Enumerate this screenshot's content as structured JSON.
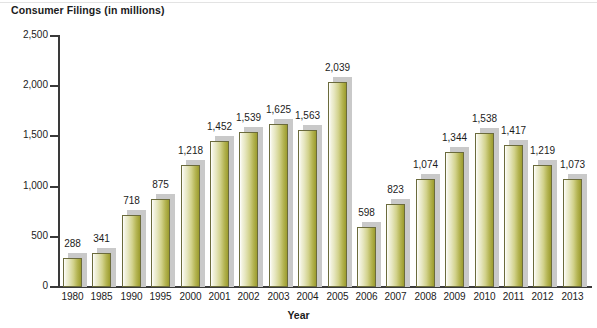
{
  "chart_data": {
    "type": "bar",
    "title": "Consumer Filings (in millions)",
    "xlabel": "Year",
    "ylabel": "",
    "ylim": [
      0,
      2500
    ],
    "ytick_labels": [
      "0",
      "500",
      "1,000",
      "1,500",
      "2,000",
      "2,500"
    ],
    "ytick_values": [
      0,
      500,
      1000,
      1500,
      2000,
      2500
    ],
    "grid": false,
    "legend": null,
    "categories": [
      "1980",
      "1985",
      "1990",
      "1995",
      "2000",
      "2001",
      "2002",
      "2003",
      "2004",
      "2005",
      "2006",
      "2007",
      "2008",
      "2009",
      "2010",
      "2011",
      "2012",
      "2013"
    ],
    "values": [
      288,
      341,
      718,
      875,
      1218,
      1452,
      1539,
      1625,
      1563,
      2039,
      598,
      823,
      1074,
      1344,
      1538,
      1417,
      1219,
      1073
    ],
    "value_labels": [
      "288",
      "341",
      "718",
      "875",
      "1,218",
      "1,452",
      "1,539",
      "1,625",
      "1,563",
      "2,039",
      "598",
      "823",
      "1,074",
      "1,344",
      "1,538",
      "1,417",
      "1,219",
      "1,073"
    ],
    "colors": {
      "bar_gradient_light": "#ffffff",
      "bar_gradient_mid": "#d2d28c",
      "bar_gradient_dark": "#9c9c2e",
      "bar_border": "#6b6b3c",
      "bar_shadow": "#c9c9c9",
      "axis": "#3a3a3a",
      "text": "#1b1b1b",
      "background": "#ffffff"
    }
  }
}
